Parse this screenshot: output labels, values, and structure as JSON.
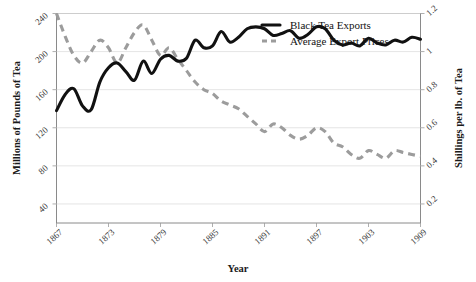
{
  "chart_data": {
    "type": "line",
    "title": "",
    "xlabel": "Year",
    "ylabel": "Millions of Pounds of Tea",
    "ylabel_right": "Shillings per lb. of Tea",
    "xlim": [
      1867,
      1909
    ],
    "ylim": [
      20,
      240
    ],
    "ylim_right": [
      0.1,
      1.2
    ],
    "grid": true,
    "legend_position": "top-right",
    "xticks": [
      "1867",
      "1873",
      "1879",
      "1885",
      "1891",
      "1897",
      "1903",
      "1909"
    ],
    "xtick_values": [
      1867,
      1873,
      1879,
      1885,
      1891,
      1897,
      1903,
      1909
    ],
    "yticks_left": [
      "40",
      "80",
      "120",
      "160",
      "200",
      "240"
    ],
    "ytick_values_left": [
      40,
      80,
      120,
      160,
      200,
      240
    ],
    "yticks_right": [
      "0.2",
      "0.4",
      "0.6",
      "0.8",
      "1",
      "1.2"
    ],
    "ytick_values_right": [
      0.2,
      0.4,
      0.6,
      0.8,
      1,
      1.2
    ],
    "x": [
      1867,
      1868,
      1869,
      1870,
      1871,
      1872,
      1873,
      1874,
      1875,
      1876,
      1877,
      1878,
      1879,
      1880,
      1881,
      1882,
      1883,
      1884,
      1885,
      1886,
      1887,
      1888,
      1889,
      1890,
      1891,
      1892,
      1893,
      1894,
      1895,
      1896,
      1897,
      1898,
      1899,
      1900,
      1901,
      1902,
      1903,
      1904,
      1905,
      1906,
      1907,
      1908,
      1909
    ],
    "series": [
      {
        "name": "Black Tea Exports",
        "axis": "left",
        "style": "solid",
        "color": "#111111",
        "units": "Millions of Pounds of Tea",
        "values": [
          138,
          155,
          161,
          143,
          139,
          168,
          183,
          188,
          179,
          170,
          190,
          177,
          192,
          196,
          190,
          193,
          212,
          204,
          206,
          221,
          210,
          215,
          224,
          226,
          224,
          217,
          219,
          222,
          214,
          218,
          226,
          224,
          212,
          207,
          209,
          206,
          214,
          209,
          207,
          212,
          210,
          215,
          213
        ]
      },
      {
        "name": "Average Export Prices",
        "axis": "right",
        "style": "dashed",
        "color": "#9c9c9c",
        "units": "Shillings per lb. of Tea",
        "values": [
          1.2,
          1.08,
          0.98,
          0.94,
          1.0,
          1.06,
          1.02,
          0.94,
          1.02,
          1.1,
          1.14,
          1.06,
          0.98,
          1.02,
          0.96,
          0.9,
          0.84,
          0.8,
          0.78,
          0.74,
          0.72,
          0.7,
          0.66,
          0.62,
          0.58,
          0.62,
          0.6,
          0.56,
          0.54,
          0.56,
          0.6,
          0.58,
          0.52,
          0.5,
          0.46,
          0.44,
          0.48,
          0.46,
          0.44,
          0.48,
          0.47,
          0.46,
          0.45
        ]
      }
    ],
    "legend": [
      {
        "label": "Black Tea Exports",
        "style": "solid",
        "color": "#111111"
      },
      {
        "label": "Average Export Prices",
        "style": "dashed",
        "color": "#9c9c9c"
      }
    ]
  }
}
